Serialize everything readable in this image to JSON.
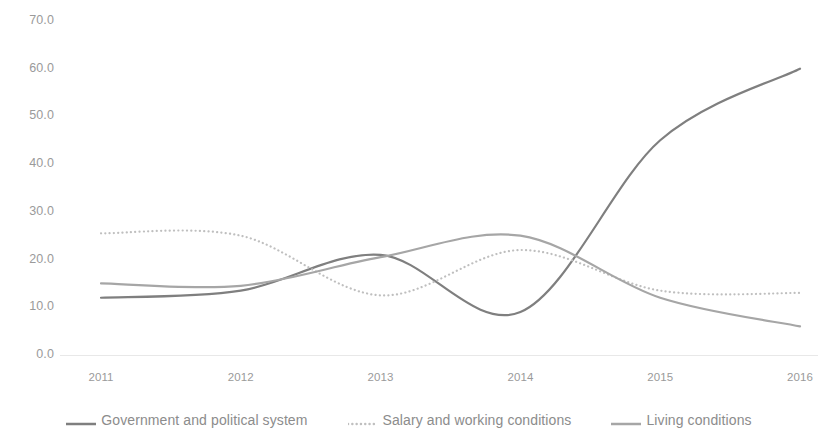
{
  "chart_data": {
    "type": "line",
    "title": "",
    "subtitle": "",
    "xlabel": "",
    "ylabel": "",
    "categories": [
      "2011",
      "2012",
      "2013",
      "2014",
      "2015",
      "2016"
    ],
    "x": [
      2011,
      2012,
      2013,
      2014,
      2015,
      2016
    ],
    "xlim": [
      2011,
      2016
    ],
    "ylim": [
      0.0,
      70.0
    ],
    "yticks": [
      "0.0",
      "10.0",
      "20.0",
      "30.0",
      "40.0",
      "50.0",
      "60.0",
      "70.0"
    ],
    "ytick_values": [
      0,
      10,
      20,
      30,
      40,
      50,
      60,
      70
    ],
    "grid": false,
    "smooth": true,
    "legend_position": "bottom",
    "series": [
      {
        "name": "Government and political system",
        "values": [
          12.0,
          13.5,
          21.0,
          9.0,
          45.0,
          60.0
        ],
        "color": "#7f7f7f",
        "style": "solid",
        "width": 2.2
      },
      {
        "name": "Salary and working conditions",
        "values": [
          25.5,
          25.0,
          12.5,
          22.0,
          13.5,
          13.0
        ],
        "color": "#bfbfbf",
        "style": "dotted",
        "width": 2.2
      },
      {
        "name": "Living conditions",
        "values": [
          15.0,
          14.5,
          20.5,
          25.0,
          12.0,
          6.0
        ],
        "color": "#a6a6a6",
        "style": "solid",
        "width": 2.2
      }
    ]
  },
  "axes": {
    "y_tick_labels": [
      "70.0",
      "60.0",
      "50.0",
      "40.0",
      "30.0",
      "20.0",
      "10.0",
      "0.0"
    ],
    "x_tick_labels": [
      "2011",
      "2012",
      "2013",
      "2014",
      "2015",
      "2016"
    ]
  },
  "legend": {
    "items": [
      {
        "label": "Government and political system",
        "color": "#7f7f7f",
        "style": "solid"
      },
      {
        "label": "Salary and working conditions",
        "color": "#bfbfbf",
        "style": "dotted"
      },
      {
        "label": "Living conditions",
        "color": "#a6a6a6",
        "style": "solid"
      }
    ]
  },
  "colors": {
    "background": "#ffffff",
    "axis": "#e8e8e8",
    "tick_text": "#9a9a9a",
    "legend_text": "#8c8c8c"
  }
}
